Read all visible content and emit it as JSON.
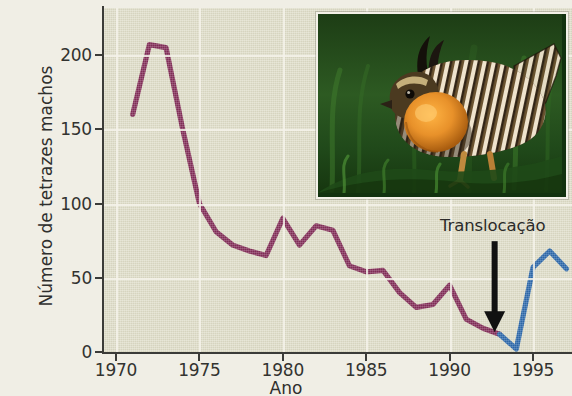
{
  "chart_data": {
    "type": "line",
    "title": "",
    "subtitle": "",
    "xlabel": "Ano",
    "ylabel": "Número de tetrazes machos",
    "xlim": [
      1970.0,
      1997.5
    ],
    "ylim": [
      0,
      225
    ],
    "grid": true,
    "legend": "none",
    "x_ticks": [
      1970,
      1975,
      1980,
      1985,
      1990,
      1995
    ],
    "y_ticks": [
      0,
      50,
      100,
      150,
      200
    ],
    "annotations": [
      {
        "text": "Translocação",
        "label": "Translocação",
        "marker": "down-arrow",
        "x": 1992.7,
        "y": 12
      }
    ],
    "series": [
      {
        "name": "Antes da translocação",
        "color": "#7b1f4e",
        "x": [
          1971,
          1972,
          1973,
          1974,
          1975,
          1976,
          1977,
          1978,
          1979,
          1980,
          1981,
          1982,
          1983,
          1984,
          1985,
          1986,
          1987,
          1988,
          1989,
          1990,
          1991,
          1992,
          1993
        ],
        "values": [
          160,
          207,
          205,
          150,
          100,
          81,
          72,
          68,
          65,
          90,
          72,
          85,
          82,
          58,
          54,
          55,
          40,
          30,
          32,
          45,
          22,
          16,
          12
        ]
      },
      {
        "name": "Depois da translocação",
        "color": "#1f5fa8",
        "x": [
          1993,
          1994,
          1995,
          1996,
          1997
        ],
        "values": [
          12,
          2,
          57,
          68,
          56
        ]
      }
    ]
  },
  "axes": {
    "y_title": "Número de tetrazes machos",
    "x_title": "Ano",
    "y_tick_labels": [
      "200",
      "150",
      "100",
      "50",
      "0"
    ],
    "x_tick_labels": [
      "1970",
      "1975",
      "1980",
      "1985",
      "1990",
      "1995"
    ]
  },
  "annotation": {
    "label": "Translocação"
  },
  "photo": {
    "alt": "Tetraz macho em exibição com saco aéreo laranja na relva",
    "subject": "prairie-chicken"
  },
  "colors": {
    "line_before": "#7b1f4e",
    "line_after": "#1f5fa8",
    "plot_background": "#dedcc7",
    "page_background": "#f0eee5",
    "axis": "#3b3b38",
    "gridline": "#f4f2ea",
    "text": "#2f2f2d"
  }
}
